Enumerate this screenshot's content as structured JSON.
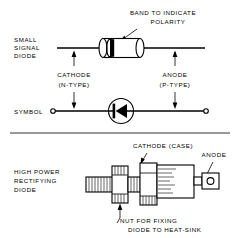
{
  "figure": {
    "background_color": "#ffffff",
    "ink_color": "#000000",
    "width": 240,
    "height": 238
  },
  "sections": {
    "small_signal": {
      "row_label_line1": "SMALL",
      "row_label_line2": "SIGNAL",
      "row_label_line3": "DIODE",
      "callout_line1": "BAND  TO  INDICATE",
      "callout_line2": "POLARITY",
      "cathode_line1": "CATHODE",
      "cathode_line2": "(N-TYPE)",
      "anode_line1": "ANODE",
      "anode_line2": "(P-TYPE)"
    },
    "symbol": {
      "row_label": "SYMBOL"
    },
    "high_power": {
      "row_label_line1": "HIGH  POWER",
      "row_label_line2": "RECTIFYING",
      "row_label_line3": "DIODE",
      "cathode_label": "CATHODE (CASE)",
      "anode_label": "ANODE",
      "nut_line1": "NUT  FOR  FIXING",
      "nut_line2": "DIODE  TO  HEAT-SINK"
    }
  }
}
